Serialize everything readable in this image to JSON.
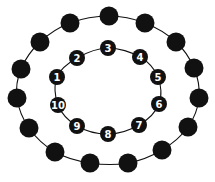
{
  "diagram": {
    "colors": {
      "node_fill": "#111111",
      "line": "#111111",
      "label": "#ffffff",
      "background": "#ffffff"
    },
    "outer_ring": {
      "node_radius": 9.5,
      "nodes": [
        {
          "x": 109,
          "y": 16
        },
        {
          "x": 145,
          "y": 23
        },
        {
          "x": 176,
          "y": 42
        },
        {
          "x": 194,
          "y": 68
        },
        {
          "x": 199,
          "y": 98
        },
        {
          "x": 188,
          "y": 127
        },
        {
          "x": 162,
          "y": 150
        },
        {
          "x": 128,
          "y": 163
        },
        {
          "x": 90,
          "y": 163
        },
        {
          "x": 55,
          "y": 152
        },
        {
          "x": 29,
          "y": 128
        },
        {
          "x": 17,
          "y": 98
        },
        {
          "x": 21,
          "y": 69
        },
        {
          "x": 40,
          "y": 42
        },
        {
          "x": 70,
          "y": 23
        }
      ]
    },
    "inner_ring": {
      "node_radius": 8,
      "nodes": [
        {
          "label": "1",
          "x": 57,
          "y": 77
        },
        {
          "label": "2",
          "x": 77,
          "y": 58
        },
        {
          "label": "3",
          "x": 108,
          "y": 48
        },
        {
          "label": "4",
          "x": 140,
          "y": 57
        },
        {
          "label": "5",
          "x": 158,
          "y": 77
        },
        {
          "label": "6",
          "x": 159,
          "y": 104
        },
        {
          "label": "7",
          "x": 139,
          "y": 125
        },
        {
          "label": "8",
          "x": 108,
          "y": 134
        },
        {
          "label": "9",
          "x": 77,
          "y": 126
        },
        {
          "label": "10",
          "x": 58,
          "y": 105
        }
      ]
    }
  }
}
